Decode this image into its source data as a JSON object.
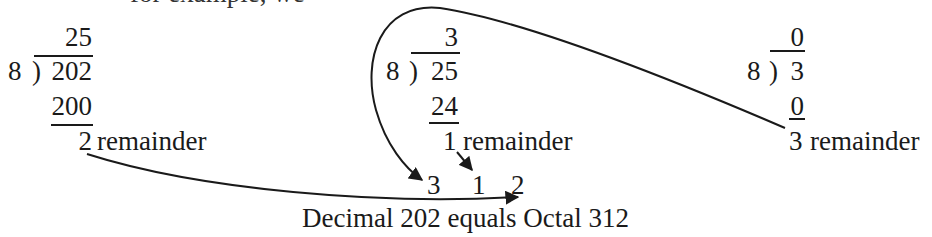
{
  "clipped_line_above": "for example, we",
  "divisions": [
    {
      "quotient": "25",
      "divisor": "8",
      "bracket": ")",
      "dividend": "202",
      "product": "200",
      "remainder": "2",
      "remainder_label": "remainder"
    },
    {
      "quotient": "3",
      "divisor": "8",
      "bracket": ")",
      "dividend": "25",
      "product": "24",
      "remainder": "1",
      "remainder_label": "remainder"
    },
    {
      "quotient": "0",
      "divisor": "8",
      "bracket": ")",
      "dividend": "3",
      "product": "0",
      "remainder": "3",
      "remainder_label": "remainder"
    }
  ],
  "result_digits": [
    "3",
    "1",
    "2"
  ],
  "caption": "Decimal 202 equals Octal 312",
  "colors": {
    "ink": "#1a1a1a",
    "background": "#ffffff"
  }
}
